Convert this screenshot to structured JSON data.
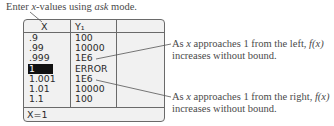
{
  "caption": {
    "prefix": "Enter ",
    "var": "x",
    "middle": "-values using ",
    "mode": "ask",
    "suffix": " mode."
  },
  "table": {
    "headers": [
      "X",
      "Y₁",
      ""
    ],
    "rows": [
      {
        "x": ".9",
        "y": "100"
      },
      {
        "x": ".99",
        "y": "10000"
      },
      {
        "x": ".999",
        "y": "1E6"
      },
      {
        "x": "1",
        "y": "ERROR",
        "selected": true
      },
      {
        "x": "1.001",
        "y": "1E6"
      },
      {
        "x": "1.01",
        "y": "10000"
      },
      {
        "x": "1.1",
        "y": "100"
      }
    ],
    "footer": "X=1"
  },
  "annotations": {
    "left": {
      "line1_a": "As ",
      "line1_var": "x",
      "line1_b": " approaches 1 from the left, ",
      "line1_fx": "f(x)",
      "line2": "increases without bound."
    },
    "right": {
      "line1_a": "As ",
      "line1_var": "x",
      "line1_b": " approaches 1 from the right, ",
      "line1_fx": "f(x)",
      "line2": "increases without bound."
    }
  }
}
